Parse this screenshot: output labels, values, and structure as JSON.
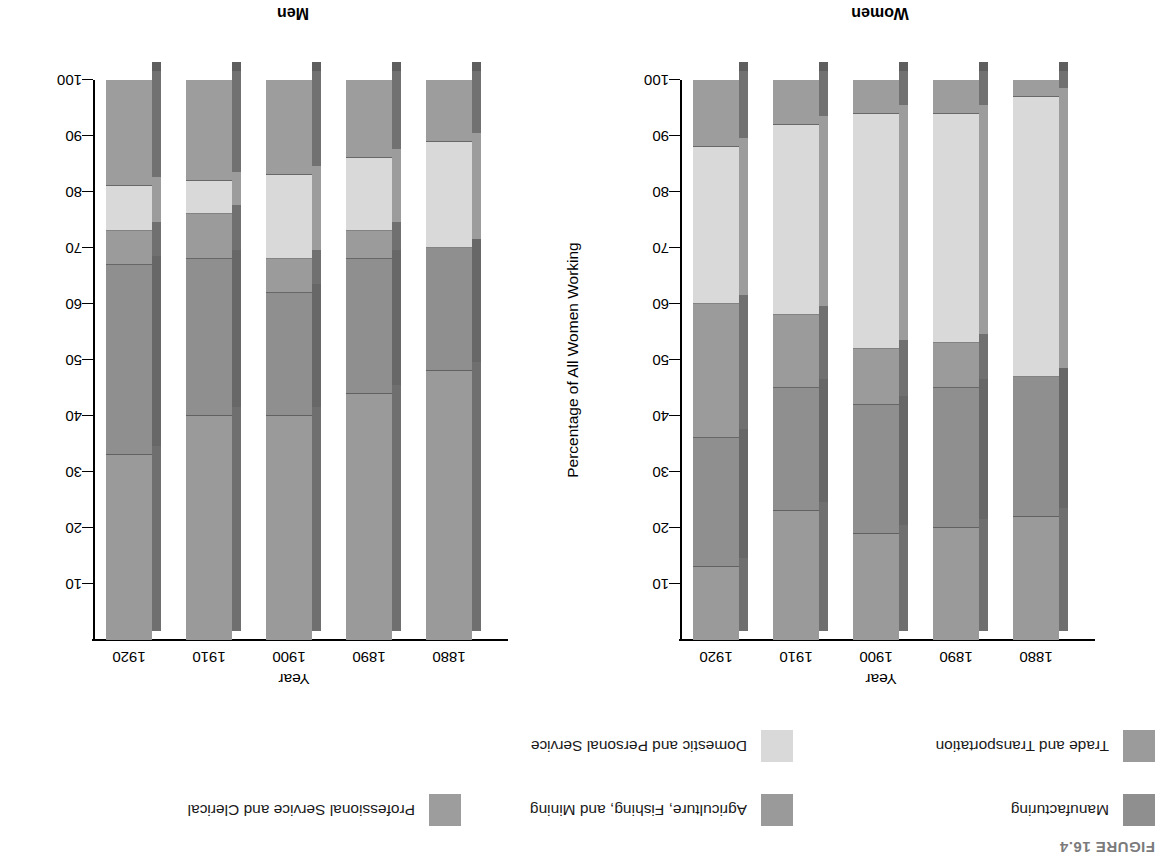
{
  "figure": {
    "label": "FIGURE 16.4"
  },
  "legend": {
    "items": [
      {
        "label": "Manufacturing",
        "color": "#8f8f8f"
      },
      {
        "label": "Agriculture, Fishing, and Mining",
        "color": "#9a9a9a"
      },
      {
        "label": "Professional Service and Clerical",
        "color": "#9d9d9d"
      },
      {
        "label": "Trade and Transportation",
        "color": "#9b9b9b"
      },
      {
        "label": "Domestic and Personal Service",
        "color": "#d9d9d9"
      }
    ]
  },
  "chart_data": [
    {
      "id": "men",
      "type": "bar",
      "subtype": "stacked-100-percent-3d",
      "title": "Men",
      "xlabel": "Year",
      "ylabel": "Percentage of All Men Working",
      "ylim": [
        0,
        100
      ],
      "yticks": [
        10,
        20,
        30,
        40,
        50,
        60,
        70,
        80,
        90,
        100
      ],
      "grid": false,
      "legend_position": "top",
      "categories": [
        "1880",
        "1890",
        "1900",
        "1910",
        "1920"
      ],
      "series": [
        {
          "name": "Agriculture, Fishing, and Mining",
          "color": "#9a9a9a",
          "values": [
            48,
            44,
            40,
            40,
            33
          ]
        },
        {
          "name": "Manufacturing",
          "color": "#8f8f8f",
          "values": [
            22,
            24,
            22,
            28,
            34
          ]
        },
        {
          "name": "Trade and Transportation",
          "color": "#9b9b9b",
          "values": [
            0,
            5,
            6,
            8,
            6
          ]
        },
        {
          "name": "Domestic and Personal Service",
          "color": "#d9d9d9",
          "values": [
            19,
            13,
            15,
            6,
            8
          ]
        },
        {
          "name": "Professional Service and Clerical",
          "color": "#9d9d9d",
          "values": [
            11,
            14,
            17,
            18,
            19
          ]
        }
      ]
    },
    {
      "id": "women",
      "type": "bar",
      "subtype": "stacked-100-percent-3d",
      "title": "Women",
      "xlabel": "Year",
      "ylabel": "Percentage of All Women Working",
      "ylim": [
        0,
        100
      ],
      "yticks": [
        10,
        20,
        30,
        40,
        50,
        60,
        70,
        80,
        90,
        100
      ],
      "grid": false,
      "legend_position": "top",
      "categories": [
        "1880",
        "1890",
        "1900",
        "1910",
        "1920"
      ],
      "series": [
        {
          "name": "Agriculture, Fishing, and Mining",
          "color": "#9a9a9a",
          "values": [
            22,
            20,
            19,
            23,
            13
          ]
        },
        {
          "name": "Manufacturing",
          "color": "#8f8f8f",
          "values": [
            25,
            25,
            23,
            22,
            23
          ]
        },
        {
          "name": "Trade and Transportation",
          "color": "#9b9b9b",
          "values": [
            0,
            8,
            10,
            13,
            24
          ]
        },
        {
          "name": "Domestic and Personal Service",
          "color": "#d9d9d9",
          "values": [
            50,
            41,
            42,
            34,
            28
          ]
        },
        {
          "name": "Professional Service and Clerical",
          "color": "#9d9d9d",
          "values": [
            3,
            6,
            6,
            8,
            12
          ]
        }
      ]
    }
  ]
}
